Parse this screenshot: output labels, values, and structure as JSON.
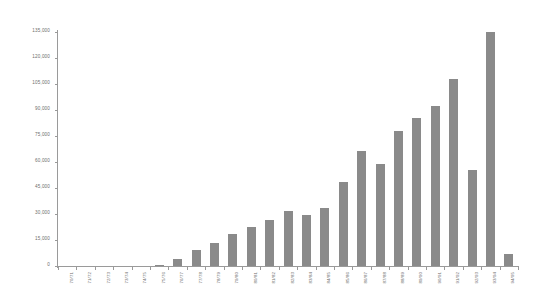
{
  "chart_data": {
    "type": "bar",
    "title": "",
    "subtitle": "",
    "xlabel": "",
    "ylabel": "",
    "categories": [
      "70/71",
      "71/72",
      "72/73",
      "73/74",
      "74/75",
      "75/76",
      "76/77",
      "77/78",
      "78/79",
      "79/80",
      "80/81",
      "81/82",
      "82/83",
      "83/84",
      "84/85",
      "85/86",
      "86/87",
      "87/88",
      "88/89",
      "89/90",
      "90/91",
      "91/92",
      "92/93",
      "93/94",
      "94/95"
    ],
    "values": [
      0,
      0,
      0,
      0,
      0,
      700,
      4200,
      9500,
      13500,
      18500,
      22500,
      26500,
      31500,
      29500,
      33500,
      48500,
      66500,
      59000,
      78000,
      85500,
      92500,
      108000,
      55500,
      135000,
      7000
    ],
    "ylim": [
      0,
      135000
    ],
    "ytick_values": [
      0,
      15000,
      30000,
      45000,
      60000,
      75000,
      90000,
      105000,
      120000,
      135000
    ],
    "ytick_labels": [
      "0",
      "15,000",
      "30,000",
      "45,000",
      "60,000",
      "75,000",
      "90,000",
      "105,000",
      "120,000",
      "135,000"
    ],
    "grid": false,
    "legend": false,
    "legend_position": "none",
    "bar_color": "#8a8a8a",
    "axis_color": "#9a9a9a",
    "text_color": "#6d6d6d",
    "background_color": "#ffffff"
  }
}
